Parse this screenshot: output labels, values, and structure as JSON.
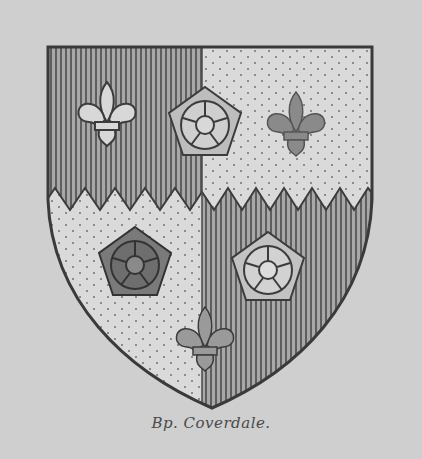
{
  "image": {
    "subject": "Heraldic coat of arms",
    "caption": "Bp. Coverdale.",
    "description": "Quarterly shield per fess indented; vertical-hatched (gules) and stippled (or) quarters with roses and fleurs-de-lis",
    "colors": {
      "background": "#cfcfcf",
      "outline": "#3c3c3c",
      "hatch": "#6a6a6a",
      "field_light": "#d9d9d9",
      "dot": "#707070"
    },
    "charges": [
      {
        "quarter": "top-left",
        "charge": "fleur-de-lis",
        "tincture": "light"
      },
      {
        "quarter": "top-middle",
        "charge": "rose",
        "tincture": "light"
      },
      {
        "quarter": "top-right",
        "charge": "fleur-de-lis",
        "tincture": "dark"
      },
      {
        "quarter": "bottom-left",
        "charge": "rose",
        "tincture": "dark"
      },
      {
        "quarter": "bottom-right",
        "charge": "rose",
        "tincture": "light"
      },
      {
        "quarter": "bottom-center",
        "charge": "fleur-de-lis",
        "tincture": "split"
      }
    ]
  }
}
